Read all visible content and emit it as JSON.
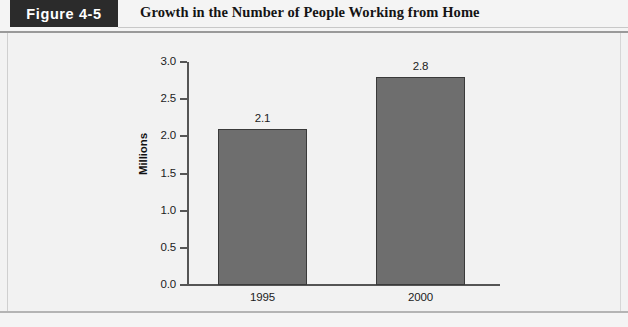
{
  "header": {
    "badge_label": "Figure 4-5",
    "title": "Growth in the Number of People Working from Home"
  },
  "colors": {
    "badge_background": "#2b2b2b",
    "badge_text": "#ffffff",
    "bar_fill": "#6e6e6e",
    "bar_stroke": "#3a3a3a",
    "axis": "#555555",
    "page_background": "#f2f2f2"
  },
  "chart_data": {
    "type": "bar",
    "title": "Growth in the Number of People Working from Home",
    "xlabel": "",
    "ylabel": "Millions",
    "categories": [
      "1995",
      "2000"
    ],
    "values": [
      2.1,
      2.8
    ],
    "value_labels": [
      "2.1",
      "2.8"
    ],
    "ylim": [
      0.0,
      3.0
    ],
    "ytick_values": [
      0.0,
      0.5,
      1.0,
      1.5,
      2.0,
      2.5,
      3.0
    ],
    "ytick_labels": [
      "0.0",
      "0.5",
      "1.0",
      "1.5",
      "2.0",
      "2.5",
      "3.0"
    ],
    "grid": false,
    "legend": false,
    "legend_position": "none"
  }
}
